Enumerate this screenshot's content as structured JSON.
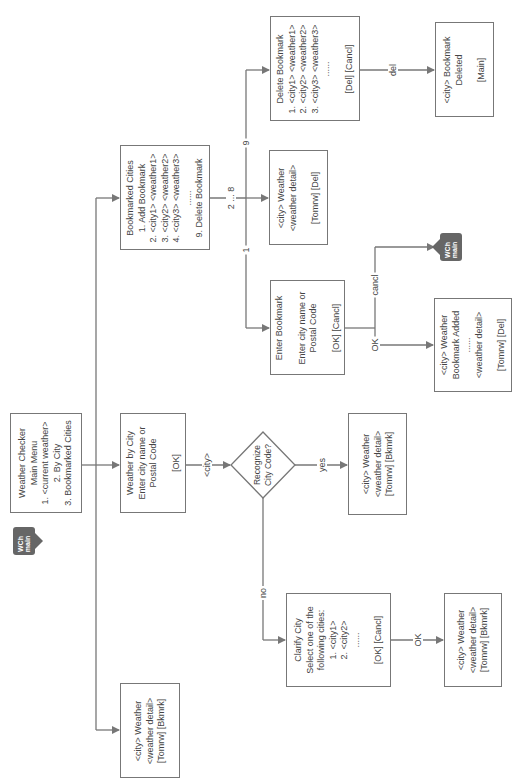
{
  "diagram": {
    "main_menu": {
      "lines": [
        "Weather Checker",
        "Main Menu",
        "1. <current weather>",
        "2. By City",
        "3. Bookmarked Cities"
      ]
    },
    "current_weather": {
      "lines": [
        "<city> Weather",
        "<weather detail>",
        "[Tomrw] [Bkmrk]"
      ]
    },
    "weather_by_city": {
      "lines": [
        "Weather by City",
        "Enter city name or",
        "Postal Code",
        "",
        "[OK]"
      ]
    },
    "bookmarked_cities": {
      "lines": [
        "Bookmarked Cities",
        "1. Add Bookmark",
        "2. <city1> <weather1>",
        "3. <city2> <weather2>",
        "4. <city3> <weather3>",
        "......",
        "9. Delete Bookmark"
      ]
    },
    "delete_bookmark": {
      "lines": [
        "Delete Bookmark",
        "1. <city1> <weather1>",
        "2. <city2> <weather2>",
        "3. <city3> <weather3>",
        "......",
        "",
        "[Del] [Cancl]"
      ]
    },
    "bookmark_deleted": {
      "lines": [
        "<city> Bookmark",
        "Deleted",
        "",
        "[Main]"
      ]
    },
    "bookmark_weather": {
      "lines": [
        "<city> Weather",
        "<weather detail>",
        "",
        "[Tomrw] [Del]"
      ]
    },
    "enter_bookmark": {
      "lines": [
        "Enter Bookmark",
        "",
        "Enter city name or",
        "Postal Code",
        "",
        "[OK] [Cancl]"
      ]
    },
    "bookmark_added": {
      "lines": [
        "<city> Weather",
        "Bookmark Added",
        "......",
        "<weather detail>",
        "",
        "[Tomrw] [Del]"
      ]
    },
    "decision": {
      "lines": [
        "Recognize",
        "City Code?"
      ]
    },
    "city_weather_yes": {
      "lines": [
        "<city> Weather",
        "<weather detail>",
        "[Tomrw] [Bkmrk]"
      ]
    },
    "clarify_city": {
      "lines": [
        "Clarify City",
        "Select one of the",
        "following cities:",
        "1. <city1>",
        "2. <city2>",
        "......",
        "",
        "[OK] [Cancl]"
      ]
    },
    "city_weather_ok": {
      "lines": [
        "<city> Weather",
        "<weather detail>",
        "[Tomrw] [Bkmrk]"
      ]
    },
    "edge_labels": {
      "city": "<city>",
      "yes": "yes",
      "no": "no",
      "one": "1",
      "two_to_eight": "2 ... 8",
      "nine": "9",
      "del": "del",
      "cancl": "cancl",
      "ok_bookmark": "OK",
      "ok_clarify": "OK"
    },
    "icons": {
      "main_icon_top": "WCh",
      "main_icon_bottom": "main"
    },
    "colors": {
      "line": "#777777",
      "icon": "#666666",
      "text": "#444444"
    }
  }
}
